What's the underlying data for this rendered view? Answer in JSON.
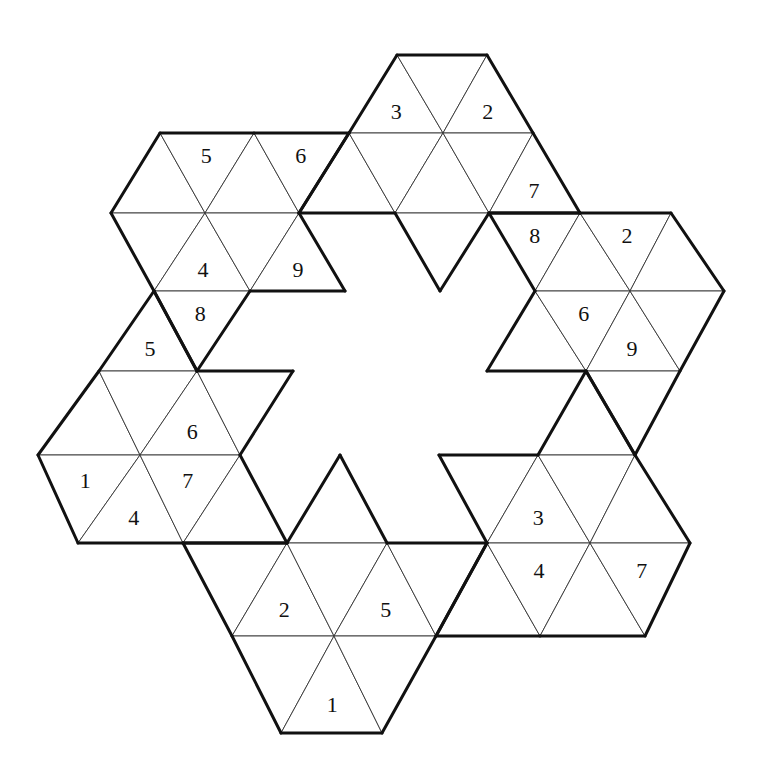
{
  "puzzle": {
    "type": "triangular-number-placement",
    "colors": {
      "background": "#ffffff",
      "line": "#111111"
    },
    "vertex_rows": [
      {
        "y": 55,
        "x": {
          "4": 397,
          "5": 487
        }
      },
      {
        "y": 133,
        "x": {
          "2": 160,
          "3": 254,
          "4": 349,
          "5": 443,
          "6": 533
        }
      },
      {
        "y": 213,
        "x": {
          "2": 111,
          "3": 205,
          "4": 299,
          "5": 395,
          "6": 489,
          "7": 580,
          "8": 671
        }
      },
      {
        "y": 291,
        "x": {
          "3": 154,
          "4": 250,
          "5": 345,
          "6": 440,
          "7": 535,
          "8": 630,
          "9": 724
        }
      },
      {
        "y": 371,
        "x": {
          "3": 99,
          "4": 197,
          "5": 293,
          "6": 390,
          "7": 487,
          "8": 586,
          "9": 680
        }
      },
      {
        "y": 455,
        "x": {
          "3": 38,
          "4": 140,
          "5": 240,
          "6": 340,
          "7": 439,
          "8": 538,
          "9": 635
        }
      },
      {
        "y": 543,
        "x": {
          "4": 78,
          "5": 183,
          "6": 287,
          "7": 387,
          "8": 487,
          "9": 590,
          "10": 690
        }
      },
      {
        "y": 636,
        "x": {
          "6": 232,
          "7": 334,
          "8": 436,
          "9": 540,
          "10": 645
        }
      },
      {
        "y": 733,
        "x": {
          "7": 281,
          "8": 382
        }
      }
    ],
    "regions": [
      {
        "name": "top",
        "cells": [
          {
            "t": "U",
            "r": 0,
            "c": 4,
            "v": "3"
          },
          {
            "t": "D",
            "r": 0,
            "c": 4,
            "v": ""
          },
          {
            "t": "U",
            "r": 0,
            "c": 5,
            "v": "2"
          },
          {
            "t": "U",
            "r": 1,
            "c": 4,
            "v": ""
          },
          {
            "t": "D",
            "r": 1,
            "c": 4,
            "v": ""
          },
          {
            "t": "U",
            "r": 1,
            "c": 5,
            "v": ""
          },
          {
            "t": "D",
            "r": 1,
            "c": 5,
            "v": ""
          },
          {
            "t": "U",
            "r": 1,
            "c": 6,
            "v": "7"
          },
          {
            "t": "D",
            "r": 2,
            "c": 5,
            "v": ""
          }
        ]
      },
      {
        "name": "top-left",
        "cells": [
          {
            "t": "U",
            "r": 1,
            "c": 2,
            "v": ""
          },
          {
            "t": "D",
            "r": 1,
            "c": 2,
            "v": "5"
          },
          {
            "t": "U",
            "r": 1,
            "c": 3,
            "v": ""
          },
          {
            "t": "D",
            "r": 1,
            "c": 3,
            "v": "6"
          },
          {
            "t": "D",
            "r": 2,
            "c": 2,
            "v": ""
          },
          {
            "t": "U",
            "r": 2,
            "c": 3,
            "v": "4"
          },
          {
            "t": "D",
            "r": 2,
            "c": 3,
            "v": ""
          },
          {
            "t": "U",
            "r": 2,
            "c": 4,
            "v": "9"
          },
          {
            "t": "D",
            "r": 3,
            "c": 3,
            "v": "8"
          }
        ]
      },
      {
        "name": "left",
        "cells": [
          {
            "t": "U",
            "r": 3,
            "c": 3,
            "v": "5"
          },
          {
            "t": "U",
            "r": 4,
            "c": 3,
            "v": ""
          },
          {
            "t": "D",
            "r": 4,
            "c": 3,
            "v": ""
          },
          {
            "t": "U",
            "r": 4,
            "c": 4,
            "v": "6"
          },
          {
            "t": "D",
            "r": 4,
            "c": 4,
            "v": ""
          },
          {
            "t": "D",
            "r": 5,
            "c": 3,
            "v": "1"
          },
          {
            "t": "U",
            "r": 5,
            "c": 4,
            "v": "4"
          },
          {
            "t": "D",
            "r": 5,
            "c": 4,
            "v": "7"
          },
          {
            "t": "U",
            "r": 5,
            "c": 5,
            "v": ""
          }
        ]
      },
      {
        "name": "bottom",
        "cells": [
          {
            "t": "U",
            "r": 5,
            "c": 6,
            "v": ""
          },
          {
            "t": "D",
            "r": 6,
            "c": 5,
            "v": ""
          },
          {
            "t": "U",
            "r": 6,
            "c": 6,
            "v": "2"
          },
          {
            "t": "D",
            "r": 6,
            "c": 6,
            "v": ""
          },
          {
            "t": "U",
            "r": 6,
            "c": 7,
            "v": "5"
          },
          {
            "t": "D",
            "r": 6,
            "c": 7,
            "v": ""
          },
          {
            "t": "D",
            "r": 7,
            "c": 6,
            "v": ""
          },
          {
            "t": "U",
            "r": 7,
            "c": 7,
            "v": "1"
          },
          {
            "t": "D",
            "r": 7,
            "c": 7,
            "v": ""
          }
        ]
      },
      {
        "name": "bottom-right",
        "cells": [
          {
            "t": "D",
            "r": 5,
            "c": 7,
            "v": ""
          },
          {
            "t": "U",
            "r": 4,
            "c": 8,
            "v": ""
          },
          {
            "t": "U",
            "r": 5,
            "c": 8,
            "v": "3"
          },
          {
            "t": "D",
            "r": 5,
            "c": 8,
            "v": ""
          },
          {
            "t": "U",
            "r": 5,
            "c": 9,
            "v": ""
          },
          {
            "t": "U",
            "r": 6,
            "c": 8,
            "v": ""
          },
          {
            "t": "D",
            "r": 6,
            "c": 8,
            "v": "4"
          },
          {
            "t": "U",
            "r": 6,
            "c": 9,
            "v": ""
          },
          {
            "t": "D",
            "r": 6,
            "c": 9,
            "v": "7"
          }
        ]
      },
      {
        "name": "right",
        "cells": [
          {
            "t": "D",
            "r": 2,
            "c": 6,
            "v": "8"
          },
          {
            "t": "U",
            "r": 2,
            "c": 7,
            "v": ""
          },
          {
            "t": "D",
            "r": 2,
            "c": 7,
            "v": "2"
          },
          {
            "t": "U",
            "r": 2,
            "c": 8,
            "v": ""
          },
          {
            "t": "U",
            "r": 3,
            "c": 7,
            "v": ""
          },
          {
            "t": "D",
            "r": 3,
            "c": 7,
            "v": "6"
          },
          {
            "t": "U",
            "r": 3,
            "c": 8,
            "v": "9"
          },
          {
            "t": "D",
            "r": 3,
            "c": 8,
            "v": ""
          },
          {
            "t": "D",
            "r": 4,
            "c": 8,
            "v": ""
          }
        ]
      }
    ]
  }
}
